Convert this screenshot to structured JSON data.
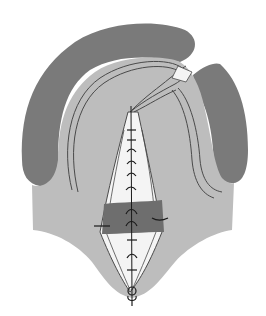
{
  "figure": {
    "title": "",
    "colors": {
      "background": "#ffffff",
      "alveolar_ridge": "#7a7a7a",
      "palate_mucosa": "#bdbdbd",
      "wound_exposed": "#f4f4f4",
      "muscle_band": "#6e6e6e",
      "suture": "#1a1a1a",
      "outline": "#4a4a4a"
    },
    "parts": [
      "alveolar-ridge-left-arch",
      "alveolar-ridge-right-segment",
      "palate-mucosa",
      "midline-cleft-wound",
      "muscle-band",
      "midline-suture",
      "uvula-knot",
      "neurovascular-bundles"
    ]
  }
}
